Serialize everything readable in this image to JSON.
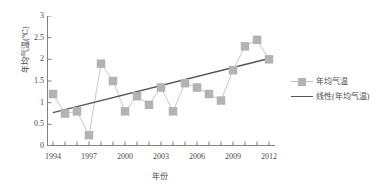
{
  "chart_data": {
    "type": "line",
    "title": "",
    "xlabel": "年份",
    "ylabel": "年均气温(℃)",
    "xlim": [
      1993.5,
      2012.5
    ],
    "ylim": [
      0,
      3
    ],
    "grid": false,
    "legend_position": "right",
    "x": [
      1994,
      1995,
      1996,
      1997,
      1998,
      1999,
      2000,
      2001,
      2002,
      2003,
      2004,
      2005,
      2006,
      2007,
      2008,
      2009,
      2010,
      2011,
      2012
    ],
    "x_tick_labels": [
      "1994",
      "1997",
      "2000",
      "2003",
      "2006",
      "2009",
      "2012"
    ],
    "x_tick_values": [
      1994,
      1997,
      2000,
      2003,
      2006,
      2009,
      2012
    ],
    "y_tick_labels": [
      "0",
      "0.5",
      "1",
      "1.5",
      "2",
      "2.5",
      "3"
    ],
    "y_tick_values": [
      0,
      0.5,
      1,
      1.5,
      2,
      2.5,
      3
    ],
    "series": [
      {
        "name": "年均气温",
        "type": "line-marker",
        "color": "#b3b3b3",
        "values": [
          1.2,
          0.75,
          0.8,
          0.25,
          1.9,
          1.5,
          0.8,
          1.15,
          0.95,
          1.35,
          0.8,
          1.45,
          1.35,
          1.2,
          1.05,
          1.75,
          2.3,
          2.45,
          2.0
        ]
      },
      {
        "name": "线性(年均气温)",
        "type": "trendline",
        "color": "#555555",
        "endpoints": [
          {
            "x": 1994,
            "y": 0.77
          },
          {
            "x": 2012,
            "y": 2.02
          }
        ]
      }
    ],
    "legend": [
      {
        "label": "年均气温",
        "marker": "square",
        "color": "#b3b3b3"
      },
      {
        "label": "线性(年均气温)",
        "marker": "line",
        "color": "#555555"
      }
    ]
  },
  "axes": {
    "y_title": "年均气温(℃)",
    "x_title": "年份"
  }
}
